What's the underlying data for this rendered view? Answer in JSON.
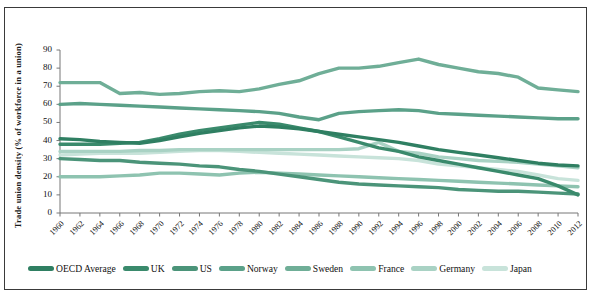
{
  "chart_data": {
    "type": "line",
    "title": "",
    "xlabel": "",
    "ylabel": "Trade union density (% of workforce in a union)",
    "ylim": [
      0,
      90
    ],
    "ytick_step": 10,
    "yticks": [
      90,
      80,
      70,
      60,
      50,
      40,
      30,
      20,
      10,
      0
    ],
    "xlim": [
      1960,
      2012
    ],
    "xtick_step": 2,
    "grid": false,
    "legend_position": "bottom",
    "x": [
      1960,
      1962,
      1964,
      1966,
      1968,
      1970,
      1972,
      1974,
      1976,
      1978,
      1980,
      1982,
      1984,
      1986,
      1988,
      1990,
      1992,
      1994,
      1996,
      1998,
      2000,
      2002,
      2004,
      2006,
      2008,
      2010,
      2012
    ],
    "series": [
      {
        "name": "OECD Average",
        "color": "#2f7f62",
        "values": [
          41,
          40.5,
          39.5,
          39,
          38.5,
          40,
          42,
          44,
          45.5,
          47,
          48,
          47.5,
          46.5,
          45,
          43.5,
          42,
          40.5,
          39,
          37,
          35,
          33.5,
          32,
          30.5,
          29,
          27.5,
          26.5,
          26
        ]
      },
      {
        "name": "UK",
        "color": "#3a8a6c",
        "values": [
          38,
          38,
          38,
          38.5,
          39,
          41,
          43.5,
          45.5,
          47,
          48.5,
          50,
          49,
          47,
          45,
          42,
          39,
          36,
          34,
          31,
          29,
          27,
          25,
          23,
          21,
          19,
          15,
          10
        ]
      },
      {
        "name": "US",
        "color": "#4b9479",
        "values": [
          30,
          29.5,
          29,
          29,
          28,
          27.5,
          27,
          26,
          25.5,
          24,
          23,
          21.5,
          20,
          18.5,
          17,
          16,
          15.5,
          15,
          14.5,
          14,
          13,
          12.5,
          12,
          12,
          11.5,
          11,
          10.5
        ]
      },
      {
        "name": "Norway",
        "color": "#5ba189",
        "values": [
          60,
          60.5,
          60,
          59.5,
          59,
          58.5,
          58,
          57.5,
          57,
          56.5,
          56,
          55,
          53,
          51.5,
          55,
          56,
          56.5,
          57,
          56.5,
          55,
          54.5,
          54,
          53.5,
          53,
          52.5,
          52,
          52
        ]
      },
      {
        "name": "Sweden",
        "color": "#6fae97",
        "values": [
          72,
          72,
          72,
          66,
          66.5,
          65.5,
          66,
          67,
          67.5,
          67,
          68.5,
          71,
          73,
          77,
          80,
          80,
          81,
          83,
          85,
          82,
          80,
          78,
          77,
          75,
          69,
          68,
          67
        ]
      },
      {
        "name": "France",
        "color": "#8ec3b0",
        "values": [
          20,
          20,
          20,
          20.5,
          21,
          22,
          22,
          21.5,
          21,
          22,
          22.5,
          22,
          21.5,
          21,
          20.5,
          20,
          19.5,
          19,
          18.5,
          18,
          17.5,
          17,
          16.5,
          16,
          15.5,
          15,
          14.5
        ]
      },
      {
        "name": "Germany",
        "color": "#a9d2c4",
        "values": [
          34,
          34,
          34,
          34,
          34.5,
          34.5,
          35,
          35,
          35,
          35,
          35,
          35,
          35,
          35,
          35,
          35.5,
          39,
          34,
          33,
          31,
          30,
          29,
          28.5,
          28,
          27,
          26,
          25
        ]
      },
      {
        "name": "Japan",
        "color": "#c8e3da",
        "values": [
          32,
          32.5,
          33,
          33,
          33,
          33.5,
          34,
          34.5,
          34.5,
          34,
          33.5,
          33,
          32.5,
          32,
          31.5,
          31,
          30.5,
          30,
          29,
          27,
          26,
          25,
          24,
          23,
          21,
          19,
          18
        ]
      }
    ]
  },
  "legend": {
    "items": [
      {
        "label": "OECD Average",
        "color": "#2f7f62"
      },
      {
        "label": "UK",
        "color": "#3a8a6c"
      },
      {
        "label": "US",
        "color": "#4b9479"
      },
      {
        "label": "Norway",
        "color": "#5ba189"
      },
      {
        "label": "Sweden",
        "color": "#6fae97"
      },
      {
        "label": "France",
        "color": "#8ec3b0"
      },
      {
        "label": "Germany",
        "color": "#a9d2c4"
      },
      {
        "label": "Japan",
        "color": "#c8e3da"
      }
    ]
  }
}
